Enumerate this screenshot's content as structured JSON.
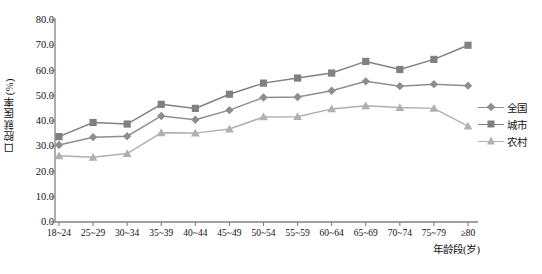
{
  "chart_data": {
    "type": "line",
    "title": "",
    "xlabel": "年龄段(岁)",
    "ylabel": "口腔就医率(%)",
    "categories": [
      "18~24",
      "25~29",
      "30~34",
      "35~39",
      "40~44",
      "45~49",
      "50~54",
      "55~59",
      "60~64",
      "65~69",
      "70~74",
      "75~79",
      "≥80"
    ],
    "ylim": [
      0,
      80
    ],
    "yticks": [
      "0.0",
      "10.0",
      "20.0",
      "30.0",
      "40.0",
      "50.0",
      "60.0",
      "70.0",
      "80.0"
    ],
    "ytick_values": [
      0,
      10,
      20,
      30,
      40,
      50,
      60,
      70,
      80
    ],
    "grid": false,
    "legend_position": "right",
    "series": [
      {
        "name": "全国",
        "marker": "diamond",
        "color": "#8e8e8e",
        "values": [
          30.5,
          33.6,
          34.0,
          42.0,
          40.5,
          44.3,
          49.3,
          49.5,
          52.0,
          55.7,
          53.8,
          54.6,
          54.0
        ]
      },
      {
        "name": "城市",
        "marker": "square",
        "color": "#808080",
        "values": [
          33.8,
          39.4,
          38.8,
          46.6,
          45.0,
          50.6,
          55.0,
          57.0,
          59.0,
          63.6,
          60.4,
          64.4,
          70.0
        ]
      },
      {
        "name": "农村",
        "marker": "triangle",
        "color": "#b0b0b0",
        "values": [
          26.2,
          25.6,
          27.1,
          35.3,
          35.2,
          36.8,
          41.6,
          41.7,
          44.8,
          46.0,
          45.3,
          45.0,
          38.0
        ]
      }
    ]
  },
  "axis": {
    "axis_color": "#808080",
    "tick_color": "#808080"
  }
}
